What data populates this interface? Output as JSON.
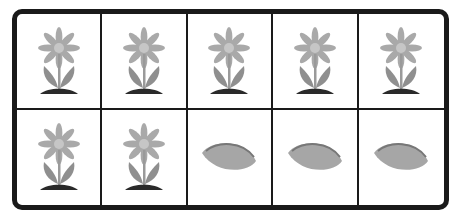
{
  "grid": {
    "rows": 2,
    "columns": 5,
    "cells": [
      {
        "row": 1,
        "col": 1,
        "item": "flower"
      },
      {
        "row": 1,
        "col": 2,
        "item": "flower"
      },
      {
        "row": 1,
        "col": 3,
        "item": "flower"
      },
      {
        "row": 1,
        "col": 4,
        "item": "flower"
      },
      {
        "row": 1,
        "col": 5,
        "item": "flower"
      },
      {
        "row": 2,
        "col": 1,
        "item": "flower"
      },
      {
        "row": 2,
        "col": 2,
        "item": "flower"
      },
      {
        "row": 2,
        "col": 3,
        "item": "seed"
      },
      {
        "row": 2,
        "col": 4,
        "item": "seed"
      },
      {
        "row": 2,
        "col": 5,
        "item": "seed"
      }
    ],
    "counts": {
      "flower": 7,
      "seed": 3,
      "total": 10
    }
  },
  "colors": {
    "border": "#1a1a1a",
    "petal": "#a8a8a8",
    "center": "#c4c4c4",
    "stem": "#9a9a9a",
    "ground": "#2a2a2a",
    "seed": "#a6a6a6",
    "seed_line": "#7a7a7a"
  }
}
